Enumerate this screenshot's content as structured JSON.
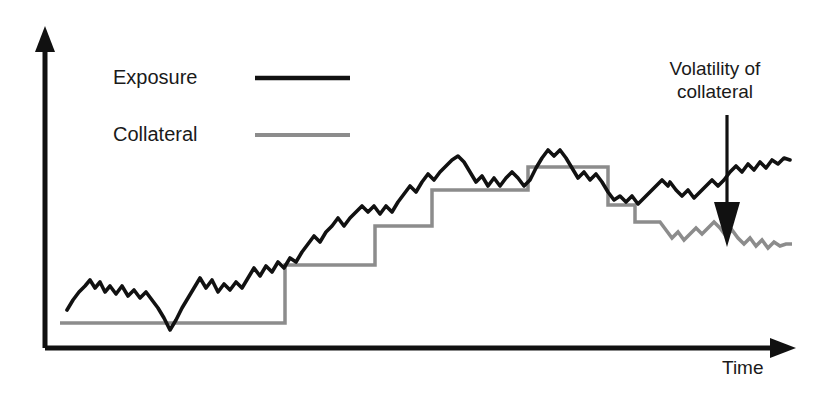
{
  "chart_data": {
    "type": "line",
    "title": "",
    "subtitle": "",
    "xlabel": "Time",
    "ylabel": "",
    "grid": false,
    "legend_position": "top-left",
    "xlim": [
      0,
      100
    ],
    "ylim": [
      0,
      100
    ],
    "axis_style": "two-arrowed-axes",
    "annotations": [
      {
        "name": "volatility-of-collateral",
        "text_line_1": "Volatility of",
        "text_line_2": "collateral",
        "arrow": "down",
        "points_to": "collateral series, right-hand volatile segment"
      }
    ],
    "legend": [
      {
        "label": "Exposure",
        "color": "#111111",
        "line_width": 3
      },
      {
        "label": "Collateral",
        "color": "#8c8c8c",
        "line_width": 3
      }
    ],
    "series": [
      {
        "name": "Exposure",
        "color": "#111111",
        "style": "jagged-random-walk",
        "description": "Noisy upward-trending exposure path that peaks mid-right then plateaus",
        "points": [
          [
            67,
            310
          ],
          [
            73,
            300
          ],
          [
            79,
            292
          ],
          [
            85,
            286
          ],
          [
            90,
            280
          ],
          [
            95,
            288
          ],
          [
            100,
            282
          ],
          [
            105,
            292
          ],
          [
            110,
            286
          ],
          [
            116,
            294
          ],
          [
            122,
            286
          ],
          [
            128,
            296
          ],
          [
            134,
            290
          ],
          [
            140,
            298
          ],
          [
            146,
            292
          ],
          [
            152,
            300
          ],
          [
            158,
            308
          ],
          [
            164,
            318
          ],
          [
            170,
            330
          ],
          [
            176,
            320
          ],
          [
            182,
            308
          ],
          [
            188,
            298
          ],
          [
            194,
            288
          ],
          [
            200,
            278
          ],
          [
            206,
            288
          ],
          [
            212,
            280
          ],
          [
            218,
            292
          ],
          [
            224,
            284
          ],
          [
            230,
            290
          ],
          [
            236,
            282
          ],
          [
            242,
            288
          ],
          [
            248,
            278
          ],
          [
            254,
            268
          ],
          [
            260,
            276
          ],
          [
            266,
            266
          ],
          [
            272,
            272
          ],
          [
            278,
            262
          ],
          [
            284,
            268
          ],
          [
            290,
            258
          ],
          [
            296,
            262
          ],
          [
            302,
            252
          ],
          [
            308,
            244
          ],
          [
            314,
            236
          ],
          [
            320,
            242
          ],
          [
            326,
            232
          ],
          [
            332,
            226
          ],
          [
            338,
            218
          ],
          [
            344,
            226
          ],
          [
            350,
            218
          ],
          [
            356,
            212
          ],
          [
            362,
            206
          ],
          [
            368,
            212
          ],
          [
            374,
            206
          ],
          [
            380,
            214
          ],
          [
            386,
            206
          ],
          [
            392,
            212
          ],
          [
            398,
            202
          ],
          [
            404,
            194
          ],
          [
            410,
            186
          ],
          [
            416,
            192
          ],
          [
            422,
            182
          ],
          [
            428,
            174
          ],
          [
            434,
            180
          ],
          [
            440,
            172
          ],
          [
            446,
            166
          ],
          [
            452,
            160
          ],
          [
            458,
            156
          ],
          [
            464,
            162
          ],
          [
            470,
            172
          ],
          [
            476,
            182
          ],
          [
            482,
            176
          ],
          [
            488,
            186
          ],
          [
            494,
            178
          ],
          [
            500,
            186
          ],
          [
            506,
            178
          ],
          [
            512,
            172
          ],
          [
            518,
            178
          ],
          [
            524,
            186
          ],
          [
            530,
            180
          ],
          [
            536,
            168
          ],
          [
            542,
            158
          ],
          [
            548,
            150
          ],
          [
            554,
            156
          ],
          [
            560,
            150
          ],
          [
            566,
            158
          ],
          [
            572,
            168
          ],
          [
            578,
            178
          ],
          [
            584,
            172
          ],
          [
            590,
            180
          ],
          [
            596,
            174
          ],
          [
            602,
            182
          ],
          [
            608,
            192
          ],
          [
            614,
            200
          ],
          [
            620,
            196
          ],
          [
            626,
            202
          ],
          [
            632,
            196
          ],
          [
            638,
            204
          ],
          [
            644,
            198
          ],
          [
            650,
            192
          ],
          [
            656,
            186
          ],
          [
            662,
            180
          ],
          [
            668,
            186
          ],
          [
            670,
            182
          ],
          [
            676,
            190
          ],
          [
            682,
            196
          ],
          [
            688,
            190
          ],
          [
            694,
            198
          ],
          [
            700,
            192
          ],
          [
            706,
            186
          ],
          [
            712,
            180
          ],
          [
            718,
            186
          ],
          [
            724,
            180
          ],
          [
            730,
            172
          ],
          [
            736,
            166
          ],
          [
            742,
            172
          ],
          [
            748,
            164
          ],
          [
            754,
            170
          ],
          [
            760,
            162
          ],
          [
            766,
            168
          ],
          [
            772,
            160
          ],
          [
            778,
            164
          ],
          [
            784,
            158
          ],
          [
            790,
            160
          ]
        ]
      },
      {
        "name": "Collateral",
        "color": "#8c8c8c",
        "style": "step-then-volatile",
        "description": "Flat then rising step function tracking exposure, dropping and becoming volatile at the right",
        "steps": [
          {
            "x_start": 60,
            "x_end": 285,
            "y": 323
          },
          {
            "x_start": 285,
            "x_end": 375,
            "y": 265
          },
          {
            "x_start": 375,
            "x_end": 432,
            "y": 226
          },
          {
            "x_start": 432,
            "x_end": 528,
            "y": 190
          },
          {
            "x_start": 528,
            "x_end": 608,
            "y": 167
          },
          {
            "x_start": 608,
            "x_end": 635,
            "y": 205
          },
          {
            "x_start": 635,
            "x_end": 660,
            "y": 222
          }
        ],
        "volatile_points": [
          [
            660,
            222
          ],
          [
            666,
            230
          ],
          [
            672,
            238
          ],
          [
            678,
            232
          ],
          [
            684,
            240
          ],
          [
            690,
            234
          ],
          [
            696,
            228
          ],
          [
            702,
            234
          ],
          [
            708,
            228
          ],
          [
            714,
            222
          ],
          [
            720,
            228
          ],
          [
            726,
            236
          ],
          [
            732,
            230
          ],
          [
            738,
            238
          ],
          [
            744,
            244
          ],
          [
            750,
            238
          ],
          [
            756,
            246
          ],
          [
            762,
            240
          ],
          [
            768,
            248
          ],
          [
            774,
            242
          ],
          [
            780,
            246
          ],
          [
            786,
            244
          ],
          [
            792,
            244
          ]
        ]
      }
    ]
  },
  "legend": {
    "exposure_label": "Exposure",
    "collateral_label": "Collateral"
  },
  "axis": {
    "x_label": "Time"
  },
  "annotation": {
    "line1": "Volatility of",
    "line2": "collateral"
  },
  "colors": {
    "exposure": "#111111",
    "collateral": "#8c8c8c",
    "axis": "#111111",
    "background": "#ffffff",
    "text": "#1a1a1a"
  }
}
